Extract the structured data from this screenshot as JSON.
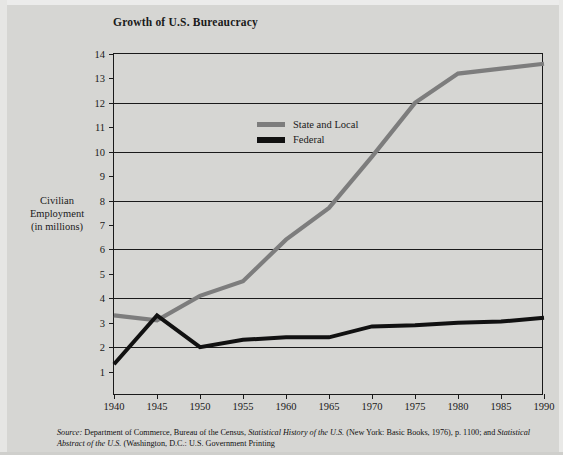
{
  "chart_data": {
    "type": "line",
    "title": "Growth of U.S. Bureaucracy",
    "xlabel": "",
    "ylabel": "Civilian Employment\n(in millions)",
    "ylabel_lines": [
      "Civilian",
      "Employment",
      "(in millions)"
    ],
    "x": [
      1940,
      1945,
      1950,
      1955,
      1960,
      1965,
      1970,
      1975,
      1980,
      1985,
      1990
    ],
    "xticklabels": [
      "1940",
      "1945",
      "1950",
      "1955",
      "1960",
      "1965",
      "1970",
      "1975",
      "1980",
      "1985",
      "1990"
    ],
    "yticks": [
      1,
      2,
      3,
      4,
      5,
      6,
      7,
      8,
      9,
      10,
      11,
      12,
      13,
      14
    ],
    "yticklabels": [
      "1",
      "2",
      "3",
      "4",
      "5",
      "6",
      "7",
      "8",
      "9",
      "10",
      "11",
      "12",
      "13",
      "14"
    ],
    "xlim": [
      1940,
      1990
    ],
    "ylim": [
      0,
      14
    ],
    "grid": "horizontal",
    "legend_position": "top-left-inside",
    "series": [
      {
        "name": "State and Local",
        "color": "#7d7d7d",
        "values": [
          3.3,
          3.1,
          4.1,
          4.7,
          6.4,
          7.7,
          9.8,
          12.0,
          13.2,
          13.4,
          13.6
        ]
      },
      {
        "name": "Federal",
        "color": "#111111",
        "values": [
          1.3,
          3.3,
          2.0,
          2.3,
          2.4,
          2.4,
          2.85,
          2.9,
          3.0,
          3.05,
          3.2
        ]
      }
    ]
  },
  "source": {
    "label": "Source:",
    "line1_a": " Department of Commerce, Bureau of the Census, ",
    "line1_italic": "Statistical History of the U.S.",
    "line1_b": " (New York: Basic",
    "line2_a": "Books, 1976), p. 1100; and ",
    "line2_italic": "Statistical Abstract of the U.S.",
    "line2_b": " (Washington, D.C.: U.S. Government Printing"
  }
}
